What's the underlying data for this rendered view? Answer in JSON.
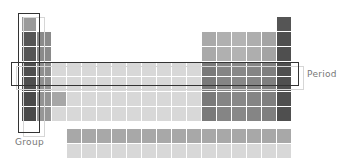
{
  "diagram": {
    "labels": {
      "group": "Group",
      "period": "Period"
    },
    "colors": {
      "background": "#ffffff",
      "highlight_border": "#333333",
      "label_text": "#777777"
    },
    "layout": {
      "main_columns": 18,
      "main_rows": 7,
      "f_block_rows": 2,
      "f_block_columns": 15,
      "highlighted_group_column": 1,
      "highlighted_period_row": 4
    }
  }
}
